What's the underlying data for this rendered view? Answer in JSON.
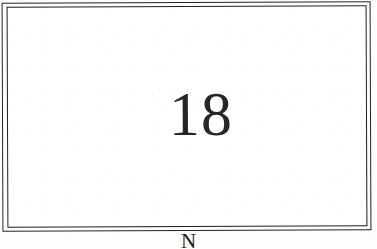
{
  "document": {
    "kind": "scanned-book-plate",
    "plate_number": "18",
    "caption_partial": "N",
    "background_color": "#fdfdfc",
    "plate_background_color": "#ffffff",
    "ink_color": "#262626",
    "rule_color": "#1e1e1e"
  },
  "frame": {
    "style": "double-rule",
    "outer_rule_label": "outer border rule",
    "inner_rule_label": "inner border rule"
  },
  "caption": {
    "visible_fragment": "N",
    "note": "top of a serif capital letter, clipped by the bottom page edge"
  }
}
